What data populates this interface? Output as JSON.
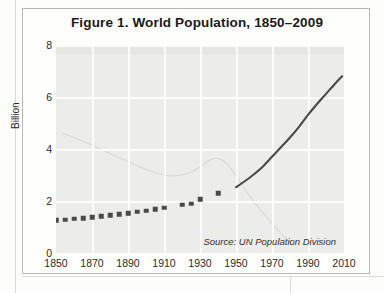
{
  "figure": {
    "title": "Figure 1. World Population, 1850–2009",
    "source_note": "Source: UN Population Division",
    "y_axis_title": "Billion"
  },
  "chart_data": {
    "type": "line",
    "title": "Figure 1. World Population, 1850–2009",
    "xlabel": "",
    "ylabel": "Billion",
    "xlim": [
      1850,
      2010
    ],
    "ylim": [
      0,
      8
    ],
    "grid": true,
    "legend": null,
    "annotations": [
      "Source: UN Population Division"
    ],
    "x_ticks": [
      1850,
      1870,
      1890,
      1910,
      1930,
      1950,
      1970,
      1990,
      2010
    ],
    "y_ticks": [
      0,
      2,
      4,
      6,
      8
    ],
    "series": [
      {
        "name": "Historical estimates",
        "style": "square-markers",
        "color": "#4a4a4a",
        "x": [
          1850,
          1855,
          1860,
          1865,
          1870,
          1875,
          1880,
          1885,
          1890,
          1895,
          1900,
          1905,
          1910,
          1920,
          1925,
          1930,
          1940
        ],
        "values": [
          1.26,
          1.28,
          1.31,
          1.34,
          1.37,
          1.41,
          1.45,
          1.49,
          1.53,
          1.58,
          1.63,
          1.69,
          1.75,
          1.86,
          1.9,
          2.07,
          2.3
        ]
      },
      {
        "name": "UN estimates",
        "style": "solid-line",
        "color": "#4a4a4a",
        "x": [
          1950,
          1955,
          1960,
          1965,
          1970,
          1975,
          1980,
          1985,
          1990,
          1995,
          2000,
          2005,
          2009
        ],
        "values": [
          2.53,
          2.77,
          3.03,
          3.33,
          3.7,
          4.07,
          4.44,
          4.85,
          5.31,
          5.73,
          6.12,
          6.51,
          6.8
        ]
      }
    ]
  }
}
